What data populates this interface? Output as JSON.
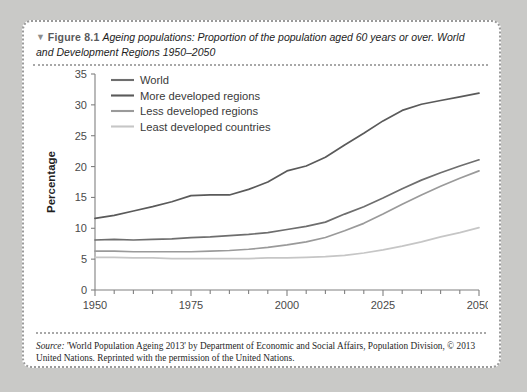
{
  "figure": {
    "marker": "▼",
    "number": "Figure 8.1",
    "caption": "Ageing populations: Proportion of the population aged 60 years or over. World and Development Regions 1950–2050"
  },
  "source": {
    "label": "Source:",
    "text": " 'World Population Ageing 2013' by Department of Economic and Social Affairs, Population Division, © 2013 United Nations. Reprinted with the permission of the United Nations."
  },
  "chart_data": {
    "type": "line",
    "title": "",
    "xlabel": "",
    "ylabel": "Percentage",
    "xlim": [
      1950,
      2050
    ],
    "ylim": [
      0,
      35
    ],
    "yticks": [
      0,
      5,
      10,
      15,
      20,
      25,
      30,
      35
    ],
    "xticks": [
      1950,
      1975,
      2000,
      2025,
      2050
    ],
    "xminor_step": 5,
    "grid": false,
    "legend_position": "top-left",
    "x": [
      1950,
      1955,
      1960,
      1965,
      1970,
      1975,
      1980,
      1985,
      1990,
      1995,
      2000,
      2005,
      2010,
      2015,
      2020,
      2025,
      2030,
      2035,
      2040,
      2045,
      2050
    ],
    "series": [
      {
        "name": "World",
        "color": "#6e6e6e",
        "values": [
          8.1,
          8.2,
          8.1,
          8.2,
          8.3,
          8.5,
          8.6,
          8.8,
          9.0,
          9.3,
          9.8,
          10.3,
          11.0,
          12.3,
          13.5,
          14.9,
          16.4,
          17.8,
          19.0,
          20.1,
          21.1
        ]
      },
      {
        "name": "More developed regions",
        "color": "#5a5a5a",
        "values": [
          11.6,
          12.1,
          12.8,
          13.5,
          14.3,
          15.3,
          15.4,
          15.4,
          16.3,
          17.5,
          19.3,
          20.1,
          21.5,
          23.5,
          25.4,
          27.4,
          29.1,
          30.1,
          30.7,
          31.3,
          31.9
        ]
      },
      {
        "name": "Less developed regions",
        "color": "#9a9a9a",
        "values": [
          6.3,
          6.3,
          6.2,
          6.2,
          6.2,
          6.2,
          6.3,
          6.4,
          6.6,
          6.9,
          7.3,
          7.8,
          8.5,
          9.6,
          10.8,
          12.3,
          13.9,
          15.4,
          16.8,
          18.1,
          19.3
        ]
      },
      {
        "name": "Least developed countries",
        "color": "#c6c6c6",
        "values": [
          5.3,
          5.3,
          5.2,
          5.2,
          5.1,
          5.1,
          5.1,
          5.1,
          5.1,
          5.2,
          5.2,
          5.3,
          5.4,
          5.6,
          6.0,
          6.5,
          7.1,
          7.8,
          8.6,
          9.3,
          10.1
        ]
      }
    ]
  }
}
